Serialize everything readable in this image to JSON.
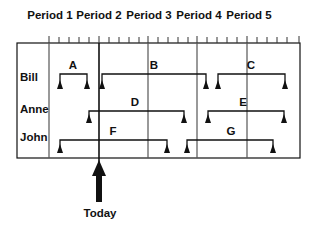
{
  "periods": [
    "Period 1",
    "Period 2",
    "Period 3",
    "Period 4",
    "Period 5"
  ],
  "people": [
    "Bill",
    "Anne",
    "John"
  ],
  "tasks": [
    {
      "label": "A",
      "person": "Bill"
    },
    {
      "label": "B",
      "person": "Bill"
    },
    {
      "label": "C",
      "person": "Bill"
    },
    {
      "label": "D",
      "person": "Anne"
    },
    {
      "label": "E",
      "person": "Anne"
    },
    {
      "label": "F",
      "person": "John"
    },
    {
      "label": "G",
      "person": "John"
    }
  ],
  "today_label": "Today",
  "colors": {
    "line": "#111111",
    "grid": "#555555"
  }
}
